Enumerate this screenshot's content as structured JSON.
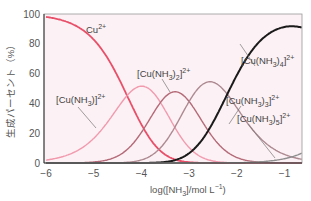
{
  "chart_data": {
    "type": "line",
    "title": "",
    "xlabel": "log([NH3]/mol L^-1)",
    "ylabel": "生成パーセント (%)",
    "xlim": [
      -6,
      -0.65
    ],
    "ylim": [
      0,
      100
    ],
    "x_ticks": [
      -6,
      -5,
      -4,
      -3,
      -2,
      -1
    ],
    "y_ticks": [
      0,
      20,
      40,
      60,
      80,
      100
    ],
    "grid": false,
    "log_stepwise_K": [
      4.3,
      3.6,
      3.0,
      2.2,
      -0.5
    ],
    "series": [
      {
        "name": "Cu2+",
        "color": "#e8506a",
        "peak_x": -6,
        "peak_y": 98
      },
      {
        "name": "[Cu(NH3)]2+",
        "color": "#f19aae",
        "peak_x": -4.2,
        "peak_y": 50
      },
      {
        "name": "[Cu(NH3)2]2+",
        "color": "#b46a78",
        "peak_x": -3.75,
        "peak_y": 50
      },
      {
        "name": "[Cu(NH3)3]2+",
        "color": "#ad8a92",
        "peak_x": -2.7,
        "peak_y": 53
      },
      {
        "name": "[Cu(NH3)4]2+",
        "color": "#1a1a1a",
        "peak_x": -1.0,
        "peak_y": 93
      },
      {
        "name": "[Cu(NH3)5]2+",
        "color": "#8f8f8f",
        "peak_x": -0.65,
        "peak_y": 10
      }
    ],
    "annotations": [
      {
        "text_main": "Cu",
        "sup": "2+",
        "x": 86,
        "y": 33
      },
      {
        "text_main": "[Cu(NH",
        "sub": "3",
        "tail": ")]",
        "sup": "2+",
        "x": 56,
        "y": 103
      },
      {
        "text_main": "[Cu(NH",
        "sub": "3",
        "tail": ")",
        "sub2": "2",
        "tail2": "]",
        "sup": "2+",
        "x": 137,
        "y": 77
      },
      {
        "text_main": "[Cu(NH",
        "sub": "3",
        "tail": ")",
        "sub2": "4",
        "tail2": "]",
        "sup": "2+",
        "x": 241,
        "y": 64
      },
      {
        "text_main": "[Cu(NH",
        "sub": "3",
        "tail": ")",
        "sub2": "3",
        "tail2": "]",
        "sup": "2+",
        "x": 226,
        "y": 104
      },
      {
        "text_main": "[Cu(NH",
        "sub": "3",
        "tail": ")",
        "sub2": "5",
        "tail2": "]",
        "sup": "2+",
        "x": 237,
        "y": 122
      }
    ]
  },
  "axis": {
    "xlabel_prefix": "log([NH",
    "xlabel_sub": "3",
    "xlabel_mid": "]/mol L",
    "xlabel_sup": "−1",
    "xlabel_suffix": ")",
    "ylabel": "生成パーセント（%）"
  }
}
